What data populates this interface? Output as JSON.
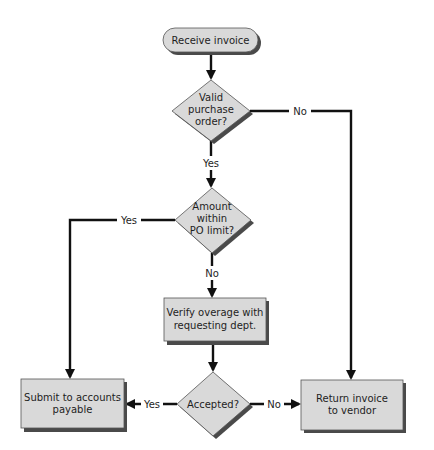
{
  "diagram": {
    "type": "flowchart",
    "colors": {
      "shape_fill": "#d9d9d9",
      "shape_shadow": "#4a4a4a",
      "line": "#111111",
      "background": "#ffffff"
    },
    "nodes": [
      {
        "id": "n1",
        "type": "terminal",
        "lines": [
          "Receive invoice"
        ]
      },
      {
        "id": "n2",
        "type": "decision",
        "lines": [
          "Valid",
          "purchase",
          "order?"
        ]
      },
      {
        "id": "n3",
        "type": "decision",
        "lines": [
          "Amount",
          "within",
          "PO limit?"
        ]
      },
      {
        "id": "n4",
        "type": "process",
        "lines": [
          "Verify overage with",
          "requesting dept."
        ]
      },
      {
        "id": "n5",
        "type": "decision",
        "lines": [
          "Accepted?"
        ]
      },
      {
        "id": "n6",
        "type": "process",
        "lines": [
          "Submit to accounts",
          "payable"
        ]
      },
      {
        "id": "n7",
        "type": "process",
        "lines": [
          "Return invoice",
          "to vendor"
        ]
      }
    ],
    "edges": [
      {
        "from": "n1",
        "to": "n2",
        "label": ""
      },
      {
        "from": "n2",
        "to": "n3",
        "label": "Yes"
      },
      {
        "from": "n2",
        "to": "n7",
        "label": "No"
      },
      {
        "from": "n3",
        "to": "n6",
        "label": "Yes"
      },
      {
        "from": "n3",
        "to": "n4",
        "label": "No"
      },
      {
        "from": "n4",
        "to": "n5",
        "label": ""
      },
      {
        "from": "n5",
        "to": "n6",
        "label": "Yes"
      },
      {
        "from": "n5",
        "to": "n7",
        "label": "No"
      }
    ]
  }
}
